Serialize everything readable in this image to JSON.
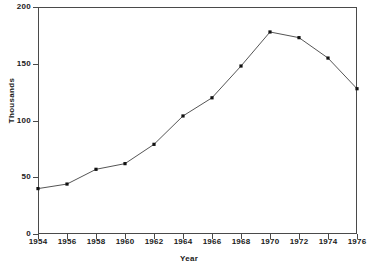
{
  "chart_data": {
    "type": "line",
    "title": "",
    "subtitle": "",
    "xlabel": "Year",
    "ylabel": "Thousands",
    "x": [
      1954,
      1956,
      1958,
      1960,
      1962,
      1964,
      1966,
      1968,
      1970,
      1972,
      1974,
      1976
    ],
    "values": [
      40,
      44,
      57,
      62,
      79,
      104,
      120,
      148,
      178,
      173,
      155,
      128
    ],
    "series": [
      {
        "name": "Thousands",
        "values": [
          40,
          44,
          57,
          62,
          79,
          104,
          120,
          148,
          178,
          173,
          155,
          128
        ]
      }
    ],
    "xtick_labels": [
      "1954",
      "1956",
      "1958",
      "1960",
      "1962",
      "1964",
      "1966",
      "1968",
      "1970",
      "1972",
      "1974",
      "1976"
    ],
    "ytick_labels": [
      "0",
      "50",
      "100",
      "150",
      "200"
    ],
    "ytick_values": [
      0,
      50,
      100,
      150,
      200
    ],
    "xlim": [
      1954,
      1976
    ],
    "ylim": [
      0,
      200
    ],
    "grid": false,
    "legend": false,
    "legend_position": "none",
    "marker": "square",
    "line_color": "#555555",
    "marker_color": "#111111",
    "axis_color": "#4a4a4a",
    "background_color": "#ffffff",
    "annotations": []
  }
}
